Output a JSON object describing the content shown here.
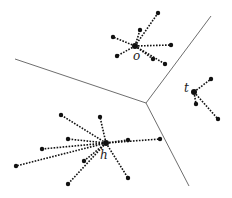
{
  "diagram": {
    "type": "voronoi-clusters",
    "width": 232,
    "height": 198,
    "colors": {
      "boundary": "#6e6e6e",
      "spoke": "#111111",
      "point": "#111111",
      "label": "#222222"
    },
    "boundaries": {
      "junction": [
        146,
        103
      ],
      "ends": [
        [
          211,
          16
        ],
        [
          15,
          59
        ],
        [
          189,
          186
        ]
      ]
    },
    "clusters": [
      {
        "label": "o",
        "center": [
          135,
          46
        ],
        "label_pos": [
          133,
          60
        ],
        "points": [
          [
            158,
            13
          ],
          [
            140,
            30
          ],
          [
            113,
            37
          ],
          [
            171,
            45
          ],
          [
            117,
            56
          ],
          [
            153,
            59
          ],
          [
            165,
            64
          ]
        ]
      },
      {
        "label": "t",
        "center": [
          194,
          92
        ],
        "label_pos": [
          184,
          92
        ],
        "points": [
          [
            211,
            79
          ],
          [
            196,
            104
          ],
          [
            218,
            119
          ]
        ]
      },
      {
        "label": "h",
        "center": [
          106,
          143
        ],
        "label_pos": [
          100,
          159
        ],
        "points": [
          [
            61,
            115
          ],
          [
            100,
            117
          ],
          [
            68,
            139
          ],
          [
            42,
            149
          ],
          [
            16,
            166
          ],
          [
            84,
            161
          ],
          [
            68,
            184
          ],
          [
            128,
            140
          ],
          [
            160,
            139
          ],
          [
            128,
            178
          ]
        ]
      }
    ]
  }
}
